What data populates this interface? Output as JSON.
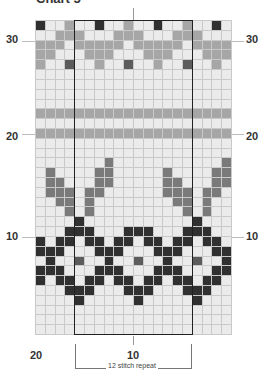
{
  "title": "Chart 5",
  "grid": {
    "columns": 20,
    "rows": 32,
    "legend_keys": {
      "L": "background (light)",
      "G": "contrast gray",
      "M": "medium gray",
      "X": "dark gray accent",
      "D": "black"
    },
    "rows_top_to_bottom": [
      "DLLGLLDLLGLLDLLGLLDL",
      "LLGGGLLLGGGLLLGGGLLL",
      "GGGLGGGGGLGGGGGLGGGG",
      "GGLLLGGGLLLGGGLLLGGG",
      "GLLXLLGLLXLLGLLXLLGL",
      "LLLLLLLLLLLLLLLLLLLL",
      "LLLLLLLLLLLLLLLLLLLL",
      "LLLLLLLLLLLLLLLLLLLL",
      "LLLLLLLLLLLLLLLLLLLL",
      "GGGGGGGGGGGGGGGGGGGG",
      "LLLLLLLLLLLLLLLLLLLL",
      "GGGGGGGGGGGGGGGGGGGG",
      "LLLLLLLLLLLLLLLLLLLL",
      "LLLLLLLLLLLLLLLLLLLL",
      "LLLLLLLMLLLLLLLLLLLM",
      "LMLLLLMMLLLLLMLLLLMM",
      "LMMLLLMMLLLLLMMLLLMM",
      "LMMMLMMLLLLLLMMMLMML",
      "LLMMLMLLLLLLLLMMLMLL",
      "LLLMLMLLLLLLLLLMLMLL",
      "LLLLDLLLLLLLLLLLDLLL",
      "LLLDDDLLLDDDLLLDDDLL",
      "DLDDLDDLDDLDDLDDLDDL",
      "DDDLLLDDDLLLDDDLLLDD",
      "LDLLXLLDLLXLLDLLXLLD",
      "DDDLLLDDDLLLDDDLLLDD",
      "DLDDLDDLDDLDDLDDLDDL",
      "LLLDDDLLLDDDLLLDDDLL",
      "LLLLDLLLLLDLLLLLDLLL",
      "LLLLLLLLLLLLLLLLLLLL",
      "LLLLLLLLLLLLLLLLLLLL",
      "LLLLLLLLLLLLLLLLLLLL"
    ]
  },
  "row_labels": {
    "left": [
      "30",
      "20",
      "10"
    ],
    "right": [
      "30",
      "20",
      "10"
    ]
  },
  "column_labels": [
    "20",
    "10"
  ],
  "repeat": {
    "label": "12 stitch repeat",
    "start_column": 5,
    "end_column": 16
  }
}
